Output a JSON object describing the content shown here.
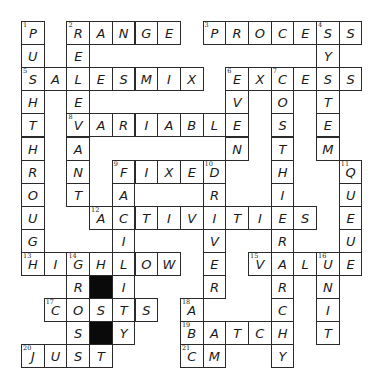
{
  "puzzle": {
    "rows": 15,
    "cols": 15,
    "cell_width": 22.7,
    "cell_height": 23.1,
    "colors": {
      "border": "#2a2a2a",
      "fill": "#ffffff",
      "block": "#0a0a0a",
      "text": "#1a1a1a"
    },
    "blocks": [
      [
        11,
        3
      ],
      [
        13,
        3
      ]
    ],
    "across": [
      {
        "number": 2,
        "answer": "RANGE",
        "row": 0,
        "col": 2
      },
      {
        "number": 3,
        "answer": "PROCESS",
        "row": 0,
        "col": 8
      },
      {
        "number": 5,
        "answer": "SALESMIX",
        "row": 2,
        "col": 0
      },
      {
        "number": 6,
        "answer": "EXCESS",
        "row": 2,
        "col": 9
      },
      {
        "number": 8,
        "answer": "VARIABLE",
        "row": 4,
        "col": 2
      },
      {
        "number": 9,
        "answer": "FIXED",
        "row": 6,
        "col": 4
      },
      {
        "number": 12,
        "answer": "ACTIVITIES",
        "row": 8,
        "col": 3
      },
      {
        "number": 13,
        "answer": "HIGHLOW",
        "row": 10,
        "col": 0
      },
      {
        "number": 15,
        "answer": "VALUE",
        "row": 10,
        "col": 10
      },
      {
        "number": 17,
        "answer": "COSTS",
        "row": 12,
        "col": 1
      },
      {
        "number": 19,
        "answer": "BATCH",
        "row": 13,
        "col": 7
      },
      {
        "number": 20,
        "answer": "JUST",
        "row": 14,
        "col": 0
      },
      {
        "number": 21,
        "answer": "CM",
        "row": 14,
        "col": 7
      }
    ],
    "down": [
      {
        "number": 1,
        "answer": "PUSHTHROUGH",
        "row": 0,
        "col": 0
      },
      {
        "number": 2,
        "answer": "RELEVANT",
        "row": 0,
        "col": 2
      },
      {
        "number": 4,
        "answer": "SYSTEM",
        "row": 0,
        "col": 13
      },
      {
        "number": 6,
        "answer": "EVEN",
        "row": 2,
        "col": 9
      },
      {
        "number": 7,
        "answer": "COSTHIERARCHY",
        "row": 2,
        "col": 11
      },
      {
        "number": 9,
        "answer": "FACILITY",
        "row": 6,
        "col": 4
      },
      {
        "number": 10,
        "answer": "DRIVER",
        "row": 6,
        "col": 8
      },
      {
        "number": 11,
        "answer": "QUEUE",
        "row": 6,
        "col": 14
      },
      {
        "number": 14,
        "answer": "GROSS",
        "row": 10,
        "col": 2
      },
      {
        "number": 16,
        "answer": "UNIT",
        "row": 10,
        "col": 13
      },
      {
        "number": 18,
        "answer": "ABC",
        "row": 12,
        "col": 7
      }
    ]
  }
}
